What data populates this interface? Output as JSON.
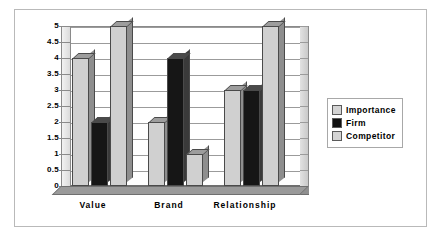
{
  "chart_data": {
    "type": "bar",
    "title": "",
    "xlabel": "",
    "ylabel": "",
    "categories": [
      "Value",
      "Brand",
      "Relationship"
    ],
    "series": [
      {
        "name": "Importance",
        "values": [
          4,
          2,
          3
        ],
        "color": "#d0d0d0"
      },
      {
        "name": "Firm",
        "values": [
          2,
          4,
          3
        ],
        "color": "#161616"
      },
      {
        "name": "Competitor",
        "values": [
          5,
          1,
          5
        ],
        "color": "#d0d0d0"
      }
    ],
    "ylim": [
      0,
      5
    ],
    "ytick_step": 0.5,
    "yticks": [
      "5",
      "4.5",
      "4",
      "3.5",
      "3",
      "2.5",
      "2",
      "1.5",
      "1",
      "0.5",
      "0"
    ],
    "grid": true,
    "legend_position": "right",
    "style": "3d-clustered-column"
  },
  "legend": {
    "items": [
      {
        "label": "Importance",
        "swatch": "light"
      },
      {
        "label": "Firm",
        "swatch": "dark"
      },
      {
        "label": "Competitor",
        "swatch": "light"
      }
    ]
  },
  "colors": {
    "frame_border": "#b9b9b9",
    "axis": "#8a8a8a",
    "gridline": "#9b9b9b",
    "bar_light": "#d0d0d0",
    "bar_dark": "#161616",
    "floor": "#8f8f8f"
  }
}
